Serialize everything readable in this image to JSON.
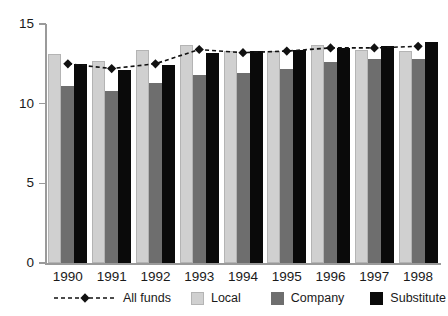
{
  "chart_data": {
    "type": "bar",
    "title": "",
    "subtitle": "",
    "xlabel": "",
    "ylabel": "",
    "categories": [
      "1990",
      "1991",
      "1992",
      "1993",
      "1994",
      "1995",
      "1996",
      "1997",
      "1998"
    ],
    "ylim": [
      0,
      15
    ],
    "yticks": [
      0,
      5,
      10,
      15
    ],
    "ytick_labels": [
      "0",
      "5",
      "10",
      "15"
    ],
    "grid": false,
    "legend_position": "bottom",
    "series": [
      {
        "name": "All funds",
        "type": "line",
        "style": "dashed",
        "marker": "diamond",
        "color": "#111111",
        "values": [
          12.5,
          12.2,
          12.5,
          13.4,
          13.2,
          13.3,
          13.5,
          13.5,
          13.6
        ]
      },
      {
        "name": "Local",
        "type": "bar",
        "color": "#d0d0d0",
        "values": [
          13.1,
          12.7,
          13.4,
          13.7,
          13.3,
          13.3,
          13.7,
          13.4,
          13.3
        ]
      },
      {
        "name": "Company",
        "type": "bar",
        "color": "#6e6e6e",
        "values": [
          11.1,
          10.8,
          11.3,
          11.8,
          11.9,
          12.2,
          12.6,
          12.8,
          12.8
        ]
      },
      {
        "name": "Substitute",
        "type": "bar",
        "color": "#0a0a0a",
        "values": [
          12.5,
          12.1,
          12.4,
          13.2,
          13.3,
          13.4,
          13.5,
          13.6,
          13.9
        ]
      }
    ]
  },
  "legend": {
    "items": [
      {
        "label": "All funds",
        "key": "line-dashed-diamond",
        "color": "#111111"
      },
      {
        "label": "Local",
        "key": "swatch",
        "color": "#d0d0d0"
      },
      {
        "label": "Company",
        "key": "swatch",
        "color": "#6e6e6e"
      },
      {
        "label": "Substitute",
        "key": "swatch",
        "color": "#0a0a0a"
      }
    ]
  },
  "colors": {
    "axis": "#9a9a9a",
    "text": "#1a1a1a",
    "background": "#ffffff"
  }
}
